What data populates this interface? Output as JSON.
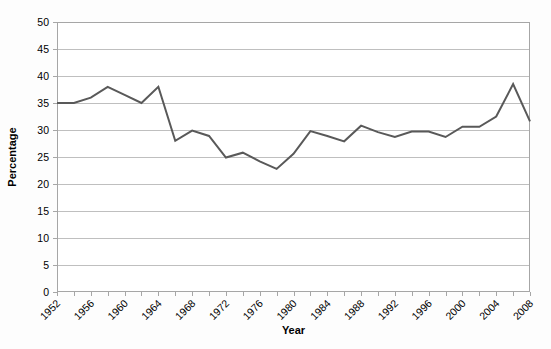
{
  "chart_data": {
    "type": "line",
    "title": "",
    "xlabel": "Year",
    "ylabel": "Percentage",
    "xlim": [
      1952,
      2008
    ],
    "ylim": [
      0,
      50
    ],
    "y_ticks": [
      0,
      5,
      10,
      15,
      20,
      25,
      30,
      35,
      40,
      45,
      50
    ],
    "x_tick_labels": [
      "1952",
      "1956",
      "1960",
      "1964",
      "1968",
      "1972",
      "1976",
      "1980",
      "1984",
      "1988",
      "1992",
      "1996",
      "2000",
      "2004",
      "2008"
    ],
    "x_tick_values": [
      1952,
      1956,
      1960,
      1964,
      1968,
      1972,
      1976,
      1980,
      1984,
      1988,
      1992,
      1996,
      2000,
      2004,
      2008
    ],
    "x_minor_step": 2,
    "grid": "horizontal",
    "legend": "none",
    "series": [
      {
        "name": "Percentage",
        "color": "#595959",
        "line_width": 2,
        "markers": "none",
        "x": [
          1952,
          1954,
          1956,
          1958,
          1960,
          1962,
          1964,
          1966,
          1968,
          1970,
          1972,
          1974,
          1976,
          1978,
          1980,
          1982,
          1984,
          1986,
          1988,
          1990,
          1992,
          1994,
          1996,
          1998,
          2000,
          2002,
          2004,
          2006,
          2008
        ],
        "values": [
          35.0,
          35.0,
          36.0,
          38.0,
          36.5,
          35.0,
          38.0,
          28.0,
          29.9,
          28.9,
          24.9,
          25.8,
          24.2,
          22.8,
          25.6,
          29.8,
          28.9,
          27.9,
          30.8,
          29.6,
          28.7,
          29.7,
          29.7,
          28.7,
          30.6,
          30.6,
          32.5,
          38.5,
          31.6
        ]
      }
    ],
    "colors": {
      "line": "#595959",
      "grid": "#bfbfbf",
      "axis": "#a6a6a6",
      "background": "#fdfdfd",
      "text": "#000000"
    }
  }
}
